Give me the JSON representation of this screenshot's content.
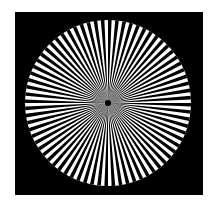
{
  "image": {
    "subject": "Siemens star test pattern",
    "background_color": "#ffffff",
    "frame_color": "#000000",
    "disc_color": "#ffffff",
    "spoke_color": "#000000",
    "spoke_count": 72
  }
}
